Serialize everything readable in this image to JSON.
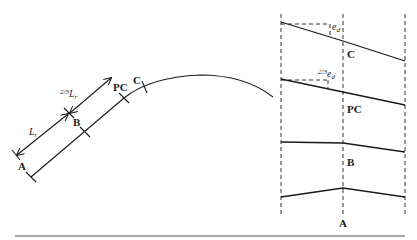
{
  "figure": {
    "type": "superelevation-transition-diagram",
    "plan_view": {
      "points": [
        {
          "id": "A",
          "label": "A"
        },
        {
          "id": "B",
          "label": "B"
        },
        {
          "id": "PC",
          "label": "PC"
        },
        {
          "id": "C",
          "label": "C"
        }
      ],
      "dimensions": [
        {
          "id": "Lr",
          "label": "L",
          "subscript": "r",
          "span": "A-B"
        },
        {
          "id": "two-thirds-Lr",
          "fraction": "2/3",
          "label": "L",
          "subscript": "r",
          "span": "B-PC"
        }
      ]
    },
    "cross_sections": [
      {
        "station": "C",
        "label": "C",
        "annotation": {
          "base": "e",
          "subscript": "d"
        },
        "profile": "full-superelevation"
      },
      {
        "station": "PC",
        "label": "PC",
        "annotation": {
          "fraction": "2/3",
          "base": "e",
          "subscript": "d"
        },
        "profile": "partial-superelevation"
      },
      {
        "station": "B",
        "label": "B",
        "profile": "adverse-crown-removed"
      },
      {
        "station": "A",
        "label": "A",
        "profile": "normal-crown"
      }
    ]
  },
  "colors": {
    "line": "#1a1a1a",
    "dashed": "#333333",
    "background": "#ffffff",
    "rule": "#555555"
  }
}
